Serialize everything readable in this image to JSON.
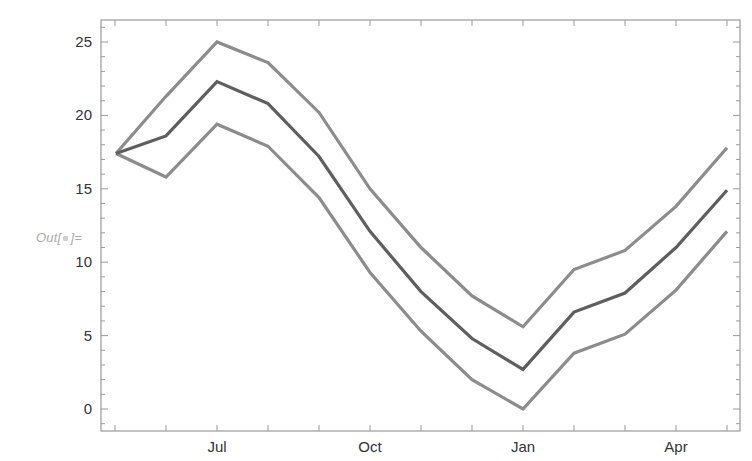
{
  "cell": {
    "out_prefix": "Out[",
    "out_suffix": "]="
  },
  "chart_data": {
    "type": "line",
    "title": "",
    "xlabel": "",
    "ylabel": "",
    "x": [
      "May",
      "Jun",
      "Jul",
      "Aug",
      "Sep",
      "Oct",
      "Nov",
      "Dec",
      "Jan",
      "Feb",
      "Mar",
      "Apr",
      "May"
    ],
    "x_tick_labels": [
      {
        "label": "Jul",
        "index": 2
      },
      {
        "label": "Oct",
        "index": 5
      },
      {
        "label": "Jan",
        "index": 8
      },
      {
        "label": "Apr",
        "index": 11
      }
    ],
    "y_tick_labels": [
      "0",
      "5",
      "10",
      "15",
      "20",
      "25"
    ],
    "ylim": [
      -1.4,
      26.4
    ],
    "grid": false,
    "legend": null,
    "series": [
      {
        "name": "upper",
        "color": "#8c8c8c",
        "values": [
          17.4,
          21.3,
          25.0,
          23.6,
          20.2,
          15.0,
          11.0,
          7.7,
          5.6,
          9.5,
          10.8,
          13.8,
          17.8
        ]
      },
      {
        "name": "middle",
        "color": "#5e5e5e",
        "values": [
          17.4,
          18.6,
          22.3,
          20.8,
          17.2,
          12.1,
          8.0,
          4.8,
          2.7,
          6.6,
          7.9,
          11.0,
          14.9
        ]
      },
      {
        "name": "lower",
        "color": "#8c8c8c",
        "values": [
          17.4,
          15.8,
          19.4,
          17.9,
          14.4,
          9.3,
          5.3,
          2.0,
          0.0,
          3.8,
          5.1,
          8.1,
          12.1
        ]
      }
    ]
  }
}
